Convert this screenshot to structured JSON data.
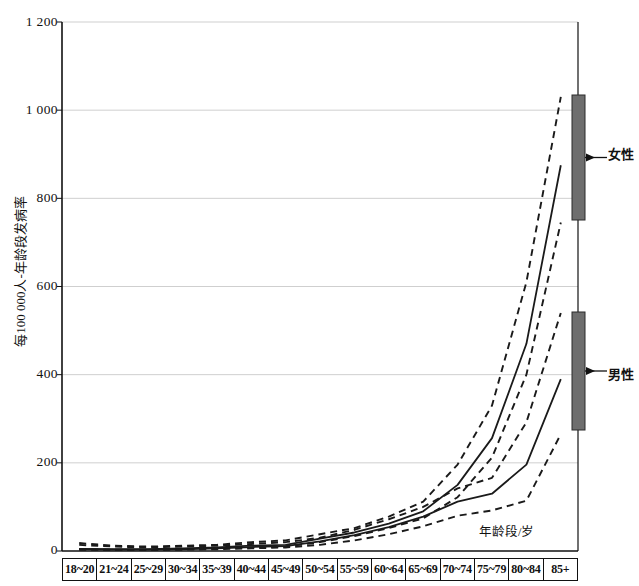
{
  "figure": {
    "axis_color": "#111111",
    "grid_color": "#cfcfcf",
    "legend_bar_color": "#6e6e6e",
    "curve_color": "#1a1a1a"
  },
  "axes": {
    "ylabel": "每100 000人-年龄段发病率",
    "xlabel": "年龄段/岁",
    "yticks": [
      "0",
      "200",
      "400",
      "600",
      "800",
      "1 000",
      "1 200"
    ],
    "ymin": 0,
    "ymax": 1200,
    "ystep": 200
  },
  "legend": {
    "female_label": "女性",
    "male_label": "男性"
  },
  "chart_data": {
    "type": "line",
    "title": "",
    "xlabel": "年龄段/岁",
    "ylabel": "每100 000人-年龄段发病率",
    "ylim": [
      0,
      1200
    ],
    "grid": true,
    "legend_position": "right",
    "categories": [
      "18~20",
      "21~24",
      "25~29",
      "30~34",
      "35~39",
      "40~44",
      "45~49",
      "50~54",
      "55~59",
      "60~64",
      "65~69",
      "70~74",
      "75~79",
      "80~84",
      "85+"
    ],
    "series": [
      {
        "name": "女性 上限",
        "style": "dashed",
        "values": [
          18,
          12,
          10,
          12,
          14,
          20,
          24,
          38,
          52,
          78,
          112,
          196,
          330,
          610,
          1030
        ]
      },
      {
        "name": "女性",
        "style": "solid",
        "values": [
          5,
          4,
          4,
          6,
          8,
          12,
          14,
          28,
          42,
          62,
          90,
          150,
          256,
          470,
          875
        ]
      },
      {
        "name": "女性 下限",
        "style": "dashed",
        "values": [
          4,
          3,
          3,
          4,
          6,
          8,
          10,
          20,
          34,
          52,
          74,
          122,
          212,
          400,
          745
        ]
      },
      {
        "name": "男性 上限",
        "style": "dashed",
        "values": [
          14,
          10,
          8,
          10,
          12,
          16,
          20,
          30,
          48,
          72,
          100,
          142,
          166,
          292,
          540
        ]
      },
      {
        "name": "男性",
        "style": "solid",
        "values": [
          4,
          3,
          3,
          4,
          6,
          9,
          11,
          22,
          36,
          54,
          78,
          112,
          130,
          196,
          390
        ]
      },
      {
        "name": "男性 下限",
        "style": "dashed",
        "values": [
          3,
          2,
          2,
          3,
          4,
          6,
          8,
          14,
          24,
          38,
          56,
          80,
          92,
          114,
          265
        ]
      }
    ]
  }
}
